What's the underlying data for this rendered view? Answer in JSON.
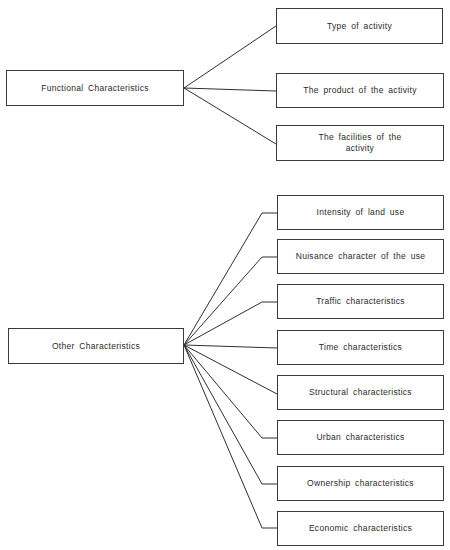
{
  "diagram": {
    "groups": [
      {
        "root": {
          "label": "Functional Characteristics",
          "box": [
            6,
            70,
            178,
            36
          ]
        },
        "children": [
          {
            "label": "Type of activity",
            "box": [
              276,
              8,
              167,
              36
            ]
          },
          {
            "label": "The product of the activity",
            "box": [
              276,
              73,
              168,
              35
            ]
          },
          {
            "label": "The facilities of the activity",
            "box": [
              276,
              125,
              168,
              36
            ]
          }
        ]
      },
      {
        "root": {
          "label": "Other Characteristics",
          "box": [
            8,
            328,
            176,
            36
          ]
        },
        "children": [
          {
            "label": "Intensity of land use",
            "box": [
              277,
              195,
              167,
              35
            ]
          },
          {
            "label": "Nuisance character of the use",
            "box": [
              277,
              239,
              167,
              35
            ]
          },
          {
            "label": "Traffic characteristics",
            "box": [
              277,
              284,
              167,
              35
            ]
          },
          {
            "label": "Time characteristics",
            "box": [
              277,
              330,
              167,
              35
            ]
          },
          {
            "label": "Structural characteristics",
            "box": [
              277,
              375,
              167,
              35
            ]
          },
          {
            "label": "Urban characteristics",
            "box": [
              277,
              420,
              167,
              35
            ]
          },
          {
            "label": "Ownership characteristics",
            "box": [
              277,
              466,
              167,
              35
            ]
          },
          {
            "label": "Economic characteristics",
            "box": [
              277,
              511,
              167,
              35
            ]
          }
        ]
      }
    ],
    "line_color": "#2f2f2f"
  }
}
